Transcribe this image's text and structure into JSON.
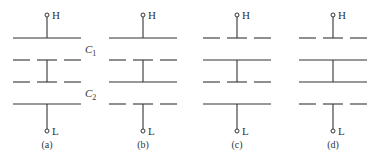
{
  "figure": {
    "line_color": "#333333",
    "panels": [
      {
        "id": "a",
        "caption": "(a)",
        "top_terminal": "H",
        "bottom_terminal": "L",
        "plates": [
          "solid",
          "dashed",
          "dashed",
          "solid"
        ],
        "connections": [
          [
            0,
            1
          ],
          [
            1,
            2
          ],
          [
            3,
            4
          ]
        ],
        "capacitor_labels": [
          {
            "text": "C",
            "sub": "1",
            "between": [
              0,
              1
            ]
          },
          {
            "text": "C",
            "sub": "2",
            "between": [
              2,
              3
            ]
          }
        ]
      },
      {
        "id": "b",
        "caption": "(b)",
        "top_terminal": "H",
        "bottom_terminal": "L",
        "plates": [
          "solid",
          "dashed",
          "solid",
          "dashed"
        ],
        "connections": [
          [
            0,
            1
          ],
          [
            1,
            2
          ],
          [
            3,
            4
          ]
        ],
        "capacitor_labels": []
      },
      {
        "id": "c",
        "caption": "(c)",
        "top_terminal": "H",
        "bottom_terminal": "L",
        "plates": [
          "dashed",
          "solid",
          "dashed",
          "solid"
        ],
        "connections": [
          [
            0,
            1
          ],
          [
            1,
            2
          ],
          [
            3,
            4
          ]
        ],
        "capacitor_labels": []
      },
      {
        "id": "d",
        "caption": "(d)",
        "top_terminal": "H",
        "bottom_terminal": "L",
        "plates": [
          "dashed",
          "solid",
          "solid",
          "dashed"
        ],
        "connections": [
          [
            0,
            1
          ],
          [
            1,
            2
          ],
          [
            3,
            4
          ]
        ],
        "capacitor_labels": []
      }
    ]
  }
}
